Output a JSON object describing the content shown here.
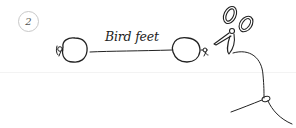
{
  "illustration": {
    "step_number": "2",
    "label": "Bird feet",
    "elements": [
      "step-number-badge",
      "left-pompom-ball",
      "left-knot",
      "connecting-thread",
      "right-pompom-ball",
      "right-knot",
      "scissors-icon",
      "thread-tail-with-knot"
    ],
    "colors": {
      "ink": "#222222",
      "badge_outline": "#c8c8c8",
      "background": "#ffffff"
    }
  }
}
